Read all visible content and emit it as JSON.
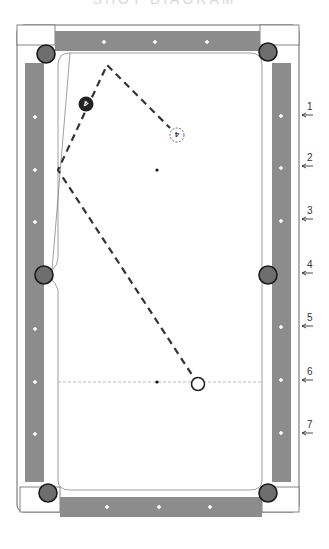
{
  "diagram": {
    "title_remnant": "SHOT DIAGRAM",
    "type": "billiards-table-diagram",
    "colors": {
      "rail": "#8c8c8c",
      "pocket": "#6e6e6e",
      "pocket_edge": "#1a1a1a",
      "frame": "#555555",
      "path": "#333333",
      "diamond": "#ffffff"
    },
    "table": {
      "frame": {
        "x": 17,
        "y": 25,
        "w": 282,
        "h": 487
      }
    },
    "pockets": [
      {
        "name": "top-left",
        "x": 46,
        "y": 54
      },
      {
        "name": "top-right",
        "x": 268,
        "y": 52
      },
      {
        "name": "side-left",
        "x": 44,
        "y": 275
      },
      {
        "name": "side-right",
        "x": 268,
        "y": 275
      },
      {
        "name": "bottom-left",
        "x": 48,
        "y": 493
      },
      {
        "name": "bottom-right",
        "x": 268,
        "y": 493
      }
    ],
    "diamonds": {
      "top": [
        [
          104,
          42
        ],
        [
          155,
          42
        ],
        [
          207,
          42
        ]
      ],
      "bottom": [
        [
          107,
          507
        ],
        [
          159,
          507
        ],
        [
          210,
          507
        ]
      ],
      "left": [
        [
          35,
          117
        ],
        [
          35,
          170
        ],
        [
          35,
          222
        ],
        [
          35,
          329
        ],
        [
          35,
          382
        ],
        [
          35,
          434
        ]
      ],
      "right": [
        [
          281,
          116
        ],
        [
          281,
          168
        ],
        [
          281,
          221
        ],
        [
          281,
          327
        ],
        [
          281,
          380
        ],
        [
          281,
          433
        ]
      ]
    },
    "spots": {
      "foot_spot": {
        "x": 157,
        "y": 170
      },
      "head_spot": {
        "x": 157,
        "y": 382
      }
    },
    "head_string": {
      "y": 382,
      "x1": 58,
      "x2": 262
    },
    "balls": {
      "cue_ball": {
        "x": 198,
        "y": 384,
        "label": ""
      },
      "object_ball": {
        "x": 86,
        "y": 104,
        "label": "4"
      },
      "ghost_ball": {
        "x": 177,
        "y": 135,
        "label": "4"
      }
    },
    "path_points": [
      [
        198,
        384
      ],
      [
        58,
        170
      ],
      [
        107,
        65
      ],
      [
        170,
        128
      ]
    ],
    "side_markers": [
      {
        "label": "1",
        "x": 305,
        "y": 110
      },
      {
        "label": "2",
        "x": 305,
        "y": 161
      },
      {
        "label": "3",
        "x": 305,
        "y": 214
      },
      {
        "label": "4",
        "x": 305,
        "y": 268
      },
      {
        "label": "5",
        "x": 305,
        "y": 321
      },
      {
        "label": "6",
        "x": 305,
        "y": 375
      },
      {
        "label": "7",
        "x": 305,
        "y": 428
      }
    ]
  }
}
